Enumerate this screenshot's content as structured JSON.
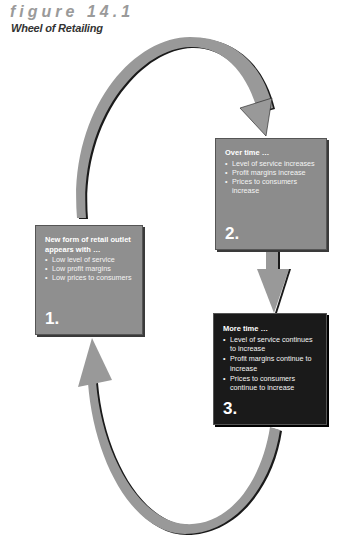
{
  "figure": {
    "label": "figure 14.1",
    "title": "Wheel of Retailing"
  },
  "stages": [
    {
      "number": "1.",
      "heading": "New form of retail outlet appears with …",
      "bullets": [
        "Low level of service",
        "Low profit margins",
        "Low prices to consumers"
      ]
    },
    {
      "number": "2.",
      "heading": "Over time …",
      "bullets": [
        "Level of service increases",
        "Profit margins increase",
        "Prices to consumers increase"
      ]
    },
    {
      "number": "3.",
      "heading": "More time …",
      "bullets": [
        "Level of service continues to increase",
        "Profit margins continue to increase",
        "Prices to consumers continue to increase"
      ]
    }
  ],
  "colors": {
    "arrow": "#999999",
    "arrow_shadow": "#1a1a1a",
    "box1": "#8f8f8f",
    "box2": "#8c8c8c",
    "box3": "#1a1a1a",
    "label": "#9a9a9a"
  },
  "arrows": [
    {
      "from": "1.",
      "to": "2."
    },
    {
      "from": "2.",
      "to": "3."
    },
    {
      "from": "3.",
      "to": "1."
    }
  ]
}
